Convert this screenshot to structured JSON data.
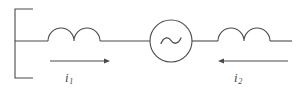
{
  "diagram": {
    "type": "circuit-schematic",
    "stroke_color": "#4a4a4a",
    "background_color": "#ffffff",
    "stroke_width": 1.1,
    "source": {
      "symbol": "~",
      "name": "ac-source",
      "center_x": 171,
      "center_y": 41,
      "radius": 21
    },
    "terminal_bracket": {
      "name": "terminal-bracket",
      "x": 15,
      "top_y": 9,
      "bottom_y": 78,
      "arm_end_x": 33
    },
    "main_line": {
      "y": 41,
      "x_start": 15,
      "x_end": 292
    },
    "inductors": [
      {
        "name": "inductor-left",
        "x_start": 48,
        "x_end": 100,
        "coils": 2,
        "arc_radius": 13
      },
      {
        "name": "inductor-right",
        "x_start": 218,
        "x_end": 270,
        "coils": 2,
        "arc_radius": 13
      }
    ],
    "currents": [
      {
        "name": "current-i1",
        "label": "i",
        "subscript": "1",
        "direction": "right",
        "arrow_x_start": 50,
        "arrow_x_end": 110,
        "arrow_y": 61
      },
      {
        "name": "current-i2",
        "label": "i",
        "subscript": "2",
        "direction": "left",
        "arrow_x_start": 288,
        "arrow_x_end": 218,
        "arrow_y": 61
      }
    ]
  }
}
